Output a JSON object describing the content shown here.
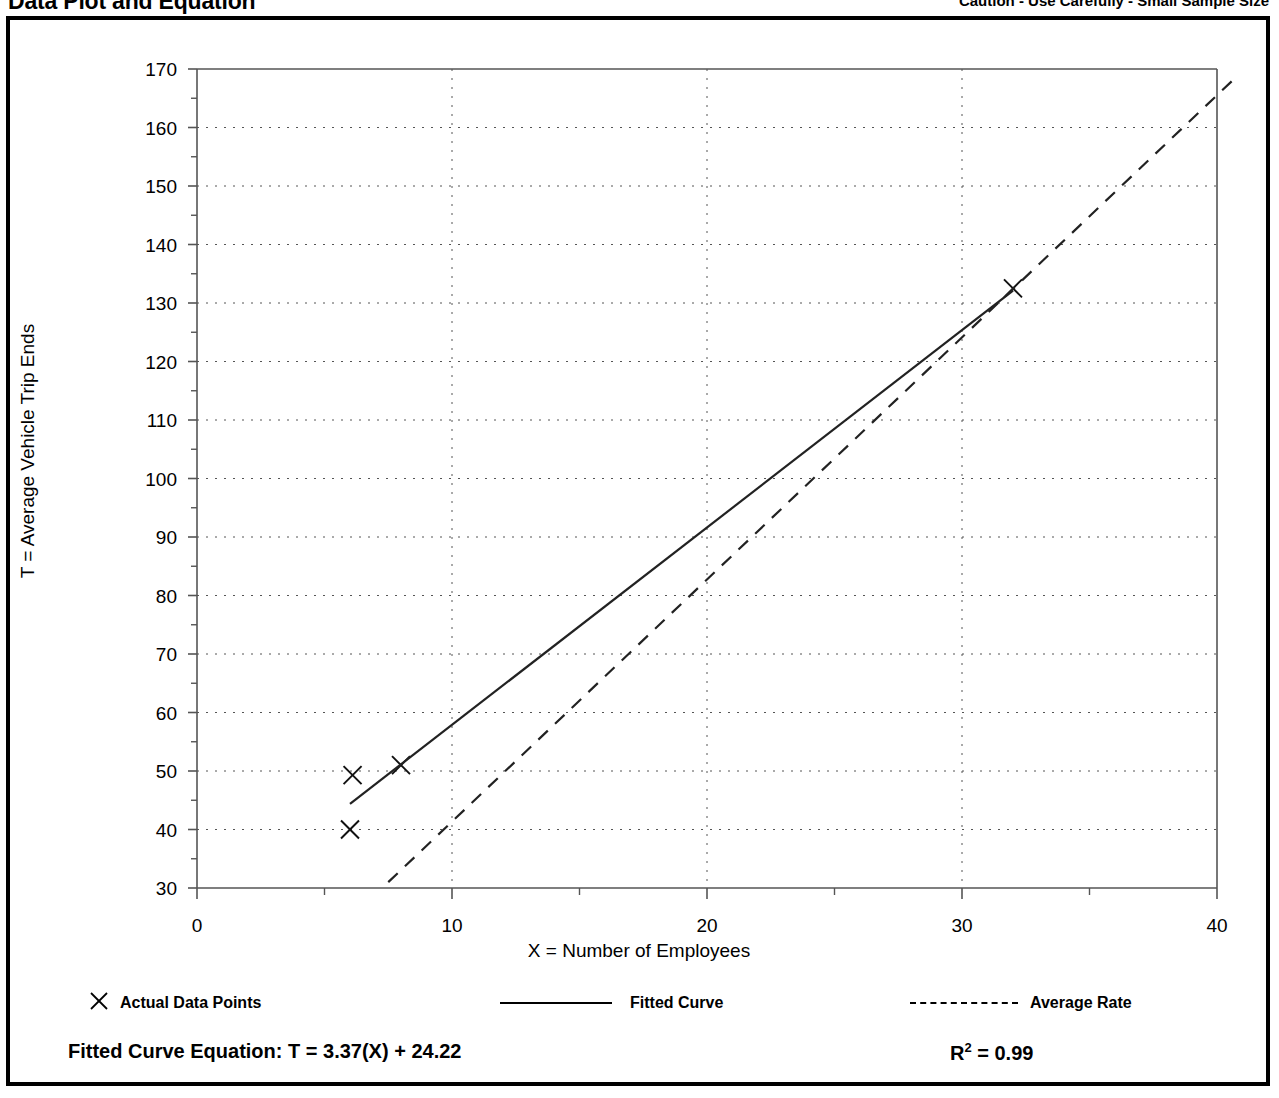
{
  "header": {
    "title": "Data Plot and Equation",
    "caution": "Caution - Use Carefully - Small Sample Size"
  },
  "legend": {
    "items": [
      {
        "label": "Actual Data Points",
        "marker": "x-marker-icon"
      },
      {
        "label": "Fitted Curve",
        "marker": "solid-line-icon"
      },
      {
        "label": "Average Rate",
        "marker": "dashed-line-icon"
      }
    ]
  },
  "equation": {
    "text": "Fitted Curve Equation:  T = 3.37(X) + 24.22",
    "r2_prefix": "R",
    "r2_exp": "2",
    "r2_value": " = 0.99"
  },
  "chart_data": {
    "type": "scatter",
    "title": "Data Plot and Equation",
    "xlabel": "X = Number of Employees",
    "ylabel": "T = Average Vehicle Trip Ends",
    "xlim": [
      0,
      40
    ],
    "ylim": [
      30,
      170
    ],
    "xticks": [
      0,
      10,
      20,
      30,
      40
    ],
    "xtick_labels": [
      "0",
      "10",
      "20",
      "30",
      "40"
    ],
    "xminor_step": 5,
    "yticks": [
      30,
      40,
      50,
      60,
      70,
      80,
      90,
      100,
      110,
      120,
      130,
      140,
      150,
      160,
      170
    ],
    "ytick_labels": [
      "30",
      "40",
      "50",
      "60",
      "70",
      "80",
      "90",
      "100",
      "110",
      "120",
      "130",
      "140",
      "150",
      "160",
      "170"
    ],
    "yminor_step": 5,
    "grid": true,
    "grid_style": "dotted",
    "legend_position": "below-axes",
    "series": [
      {
        "name": "Actual Data Points",
        "type": "scatter",
        "marker": "x",
        "points": [
          {
            "x": 6.0,
            "y": 40.0
          },
          {
            "x": 6.1,
            "y": 49.3
          },
          {
            "x": 8.0,
            "y": 51.0
          },
          {
            "x": 32.0,
            "y": 132.5
          }
        ]
      },
      {
        "name": "Fitted Curve",
        "type": "line",
        "style": "solid",
        "equation": "T = 3.37(X) + 24.22",
        "slope": 3.37,
        "intercept": 24.22,
        "r_squared": 0.99,
        "x_range": [
          6.0,
          32.0
        ],
        "endpoints": [
          {
            "x": 6.0,
            "y": 44.4
          },
          {
            "x": 32.0,
            "y": 132.1
          }
        ]
      },
      {
        "name": "Average Rate",
        "type": "line",
        "style": "dashed",
        "slope": 4.14,
        "intercept": 0,
        "x_range": [
          7.5,
          40.5
        ],
        "endpoints": [
          {
            "x": 7.5,
            "y": 31.0
          },
          {
            "x": 40.6,
            "y": 168.0
          }
        ]
      }
    ],
    "annotations": [
      {
        "text": "Caution - Use Carefully - Small Sample Size",
        "position": "top-right"
      }
    ]
  }
}
